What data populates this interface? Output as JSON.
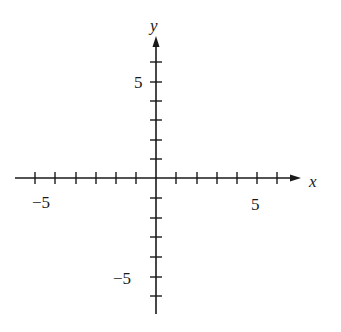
{
  "diagram": {
    "type": "cartesian-coordinate-plane",
    "x_axis": {
      "label": "x",
      "min": -6,
      "max": 6,
      "tick_step": 1,
      "labeled_ticks": [
        {
          "value": -5,
          "text": "−5"
        },
        {
          "value": 5,
          "text": "5"
        }
      ]
    },
    "y_axis": {
      "label": "y",
      "min": -7,
      "max": 6,
      "tick_step": 1,
      "labeled_ticks": [
        {
          "value": 5,
          "text": "5"
        },
        {
          "value": -5,
          "text": "−5"
        }
      ]
    },
    "colors": {
      "ink": "#1a1a1a",
      "background": "#ffffff"
    }
  }
}
